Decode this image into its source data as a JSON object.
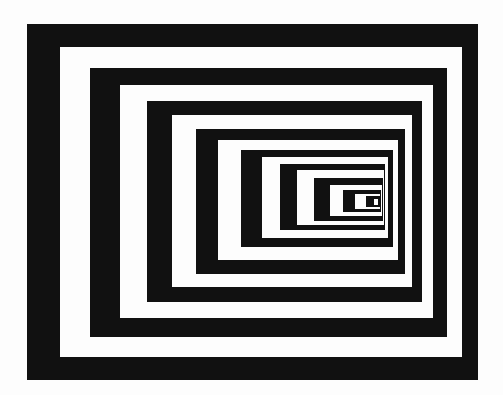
{
  "image": {
    "description": "Op-art tunnel of nested alternating black and white rectangles converging toward the right-center",
    "background": "#fdfdfd",
    "colors": {
      "black": "#111111",
      "white": "#fdfdfd"
    },
    "rects": [
      {
        "l": 27,
        "t": 24,
        "r": 478,
        "b": 380,
        "c": "black"
      },
      {
        "l": 60,
        "t": 47,
        "r": 462,
        "b": 357,
        "c": "white"
      },
      {
        "l": 90,
        "t": 68,
        "r": 447,
        "b": 337,
        "c": "black"
      },
      {
        "l": 120,
        "t": 85,
        "r": 433,
        "b": 318,
        "c": "white"
      },
      {
        "l": 147,
        "t": 101,
        "r": 422,
        "b": 302,
        "c": "black"
      },
      {
        "l": 172,
        "t": 115,
        "r": 412,
        "b": 287,
        "c": "white"
      },
      {
        "l": 196,
        "t": 129,
        "r": 405,
        "b": 274,
        "c": "black"
      },
      {
        "l": 218,
        "t": 140,
        "r": 398,
        "b": 260,
        "c": "white"
      },
      {
        "l": 241,
        "t": 150,
        "r": 393,
        "b": 247,
        "c": "black"
      },
      {
        "l": 262,
        "t": 157,
        "r": 388,
        "b": 238,
        "c": "white"
      },
      {
        "l": 280,
        "t": 164,
        "r": 385,
        "b": 230,
        "c": "black"
      },
      {
        "l": 297,
        "t": 170,
        "r": 384,
        "b": 225,
        "c": "white"
      },
      {
        "l": 314,
        "t": 178,
        "r": 383,
        "b": 221,
        "c": "black"
      },
      {
        "l": 330,
        "t": 185,
        "r": 382,
        "b": 216,
        "c": "white"
      },
      {
        "l": 343,
        "t": 190,
        "r": 381,
        "b": 212,
        "c": "black"
      },
      {
        "l": 355,
        "t": 194,
        "r": 380,
        "b": 209,
        "c": "white"
      },
      {
        "l": 366,
        "t": 196,
        "r": 380,
        "b": 207,
        "c": "black"
      },
      {
        "l": 374,
        "t": 199,
        "r": 378,
        "b": 205,
        "c": "white"
      }
    ]
  }
}
